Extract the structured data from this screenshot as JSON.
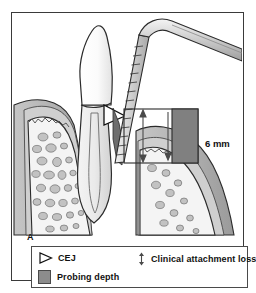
{
  "figure": {
    "panel_letter": "A",
    "measurement_label": "6 mm"
  },
  "legend": {
    "items": [
      {
        "symbol": "cej-triangle-icon",
        "label": "CEJ"
      },
      {
        "symbol": "probing-depth-swatch-icon",
        "label": "Probing depth"
      },
      {
        "symbol": "double-arrow-icon",
        "label": "Clinical attachment loss"
      }
    ]
  },
  "colors": {
    "frame_border": "#3a3a3a",
    "outline": "#2b2b2b",
    "gingiva_fill": "#b9b9b9",
    "gingiva_dark": "#8f8f8f",
    "bone_fill": "#f2f2f2",
    "trabecula_fill": "#bdbdbd",
    "tooth_enamel": "#fdfdfd",
    "tooth_dentin": "#e8e8e8",
    "probe_body": "#d6d6d6",
    "probing_depth_block": "#808080",
    "background": "#ffffff"
  },
  "anatomy": {
    "parts": [
      "tooth-crown",
      "tooth-root",
      "gingiva",
      "alveolar-bone",
      "trabecular-bone",
      "periodontal-pocket",
      "periodontal-probe",
      "cej-marker",
      "attachment-loss-arrow",
      "probing-depth-block"
    ]
  }
}
